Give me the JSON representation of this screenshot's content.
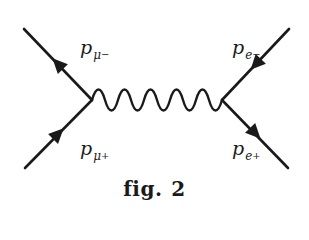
{
  "diagram": {
    "type": "Feynman diagram",
    "process": "mu- mu+ -> e- e+ annihilation via photon",
    "caption": {
      "prefix": "fig.",
      "number": "2"
    },
    "line_color": "#1a1a1a",
    "vertices": [
      {
        "id": "left",
        "x": 92,
        "y": 100
      },
      {
        "id": "right",
        "x": 222,
        "y": 100
      }
    ],
    "external_lines": [
      {
        "id": "mu-minus",
        "from": [
          24,
          29
        ],
        "to": [
          92,
          100
        ],
        "arrow": "outward",
        "label": {
          "p": "p",
          "sub": "μ",
          "sup": "−"
        }
      },
      {
        "id": "mu-plus",
        "from": [
          25,
          168
        ],
        "to": [
          92,
          100
        ],
        "arrow": "inward",
        "label": {
          "p": "p",
          "sub": "μ",
          "sup": "+"
        }
      },
      {
        "id": "e-minus",
        "from": [
          289,
          29
        ],
        "to": [
          222,
          100
        ],
        "arrow": "inward",
        "label": {
          "p": "p",
          "sub": "e",
          "sup": "−"
        }
      },
      {
        "id": "e-plus",
        "from": [
          288,
          168
        ],
        "to": [
          222,
          100
        ],
        "arrow": "outward",
        "label": {
          "p": "p",
          "sub": "e",
          "sup": "+"
        }
      }
    ],
    "propagator": {
      "type": "photon (wavy)",
      "periods": 5
    }
  }
}
